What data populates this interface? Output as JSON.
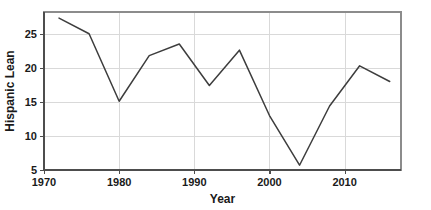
{
  "chart_data": {
    "type": "line",
    "title": "",
    "xlabel": "Year",
    "ylabel": "Hispanic Lean",
    "xlim": [
      1970,
      2017.5
    ],
    "ylim": [
      5,
      28.2
    ],
    "xticks": [
      1970,
      1980,
      1990,
      2000,
      2010
    ],
    "xtick_labels": [
      "1970",
      "1980",
      "1990",
      "2000",
      "2010"
    ],
    "yticks": [
      5,
      10,
      15,
      20,
      25
    ],
    "ytick_labels": [
      "5",
      "10",
      "15",
      "20",
      "25"
    ],
    "grid": true,
    "grid_axis": "y",
    "legend": false,
    "line_color": "#3d3d3d",
    "x": [
      1972,
      1976,
      1980,
      1984,
      1988,
      1992,
      1996,
      2000,
      2004,
      2008,
      2012,
      2016
    ],
    "values": [
      27.3,
      25.0,
      15.1,
      21.8,
      23.5,
      17.4,
      22.6,
      13.0,
      5.7,
      14.4,
      20.3,
      18.0
    ],
    "series": [
      {
        "name": "Hispanic Lean",
        "values": [
          27.3,
          25.0,
          15.1,
          21.8,
          23.5,
          17.4,
          22.6,
          13.0,
          5.7,
          14.4,
          20.3,
          18.0
        ]
      }
    ]
  }
}
